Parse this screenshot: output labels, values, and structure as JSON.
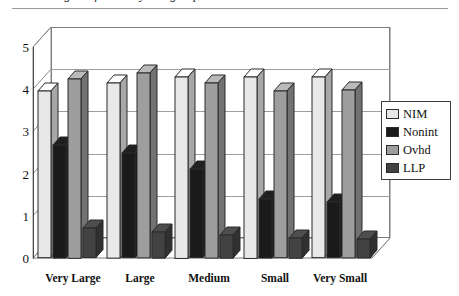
{
  "title": {
    "clipped_text": "rgins of banks by size groups",
    "rule": "horizontal-rule"
  },
  "chart_data": {
    "type": "bar",
    "title": "",
    "xlabel": "",
    "ylabel": "",
    "ylim": [
      0,
      5
    ],
    "yticks": [
      "0",
      "1",
      "2",
      "3",
      "4",
      "5"
    ],
    "grid": true,
    "three_d": true,
    "legend_position": "right",
    "categories": [
      "Very Large",
      "Large",
      "Medium",
      "Small",
      "Very Small"
    ],
    "series": [
      {
        "name": "NIM",
        "color": "#e8e8e8",
        "values": [
          3.95,
          4.15,
          4.3,
          4.3,
          4.28
        ]
      },
      {
        "name": "Nonint",
        "color": "#1a1a1a",
        "values": [
          2.68,
          2.48,
          2.1,
          1.4,
          1.32
        ]
      },
      {
        "name": "Ovhd",
        "color": "#9e9e9e",
        "values": [
          4.25,
          4.38,
          4.15,
          3.95,
          3.98
        ]
      },
      {
        "name": "LLP",
        "color": "#424242",
        "values": [
          0.7,
          0.62,
          0.55,
          0.48,
          0.45
        ]
      }
    ]
  },
  "legend": {
    "items": [
      {
        "label": "NIM",
        "swatch": "#e8e8e8"
      },
      {
        "label": "Nonint",
        "swatch": "#1a1a1a"
      },
      {
        "label": "Ovhd",
        "swatch": "#9e9e9e"
      },
      {
        "label": "LLP",
        "swatch": "#424242"
      }
    ]
  }
}
